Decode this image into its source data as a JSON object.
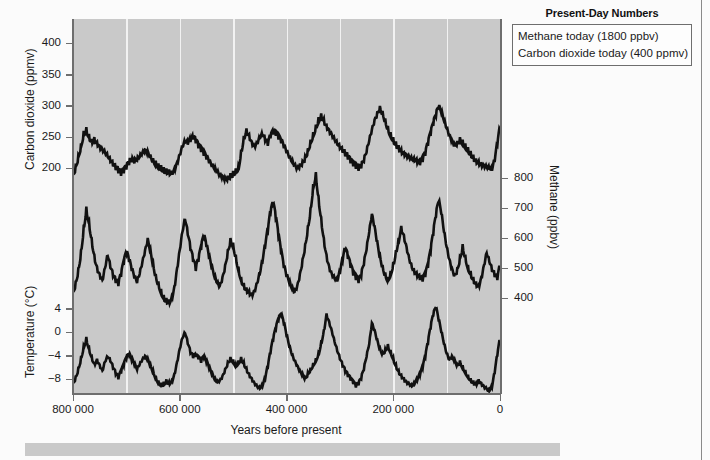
{
  "figure": {
    "xaxis_title": "Years before present",
    "legend": {
      "title": "Present-Day Numbers",
      "rows": [
        "Methane today (1800 ppbv)",
        "Carbon dioxide today (400 ppmv)"
      ]
    },
    "axes": {
      "co2_title": "Carbon dioxide (ppmv)",
      "methane_title": "Methane (ppbv)",
      "temperature_title": "Temperature (°C)",
      "co2_ticks": [
        "400",
        "350",
        "300",
        "250",
        "200"
      ],
      "methane_ticks": [
        "800",
        "700",
        "600",
        "500",
        "400"
      ],
      "temperature_ticks": [
        "4",
        "0",
        "−4",
        "−8"
      ],
      "x_ticks": [
        "800 000",
        "600 000",
        "400 000",
        "200 000",
        "0"
      ]
    },
    "colors": {
      "plot_background": "#c9c9c9",
      "gridline": "#f2f2f2",
      "trace": "#111111",
      "axis": "#6e6e6e",
      "page_background": "#fbfbfb",
      "caption_strip": "#c9c9c9"
    }
  },
  "chart_data": {
    "type": "line",
    "title": "",
    "subtitle": "",
    "xlabel": "Years before present",
    "ylabel": "",
    "grid": "vertical-only",
    "legend_position": "top-right-box",
    "x_reversed": true,
    "xlim": [
      800000,
      0
    ],
    "x_ticks": [
      800000,
      600000,
      400000,
      200000,
      0
    ],
    "x_tick_labels": [
      "800 000",
      "600 000",
      "400 000",
      "200 000",
      "0"
    ],
    "panels": [
      {
        "name": "Carbon dioxide",
        "axis_side": "left",
        "units": "ppmv",
        "ylabel": "Carbon dioxide (ppmv)",
        "ylim": [
          170,
          420
        ],
        "y_ticks": [
          200,
          250,
          300,
          350,
          400
        ],
        "present_day_value": 400,
        "series_name": "Carbon dioxide",
        "x": [
          800000,
          795000,
          790000,
          785000,
          780000,
          775000,
          770000,
          765000,
          760000,
          755000,
          750000,
          745000,
          740000,
          735000,
          730000,
          725000,
          720000,
          715000,
          710000,
          705000,
          700000,
          695000,
          690000,
          685000,
          680000,
          675000,
          670000,
          665000,
          660000,
          655000,
          650000,
          645000,
          640000,
          635000,
          630000,
          625000,
          620000,
          615000,
          610000,
          605000,
          600000,
          595000,
          590000,
          585000,
          580000,
          575000,
          570000,
          565000,
          560000,
          555000,
          550000,
          545000,
          540000,
          535000,
          530000,
          525000,
          520000,
          515000,
          510000,
          505000,
          500000,
          495000,
          490000,
          485000,
          480000,
          475000,
          470000,
          465000,
          460000,
          455000,
          450000,
          445000,
          440000,
          435000,
          430000,
          425000,
          420000,
          415000,
          410000,
          405000,
          400000,
          395000,
          390000,
          385000,
          380000,
          375000,
          370000,
          365000,
          360000,
          355000,
          350000,
          345000,
          340000,
          335000,
          330000,
          325000,
          320000,
          315000,
          310000,
          305000,
          300000,
          295000,
          290000,
          285000,
          280000,
          275000,
          270000,
          265000,
          260000,
          255000,
          250000,
          245000,
          240000,
          235000,
          230000,
          225000,
          220000,
          215000,
          210000,
          205000,
          200000,
          195000,
          190000,
          185000,
          180000,
          175000,
          170000,
          165000,
          160000,
          155000,
          150000,
          145000,
          140000,
          135000,
          130000,
          125000,
          120000,
          115000,
          110000,
          105000,
          100000,
          95000,
          90000,
          85000,
          80000,
          75000,
          70000,
          65000,
          60000,
          55000,
          50000,
          45000,
          40000,
          35000,
          30000,
          25000,
          20000,
          15000,
          10000,
          5000,
          0
        ],
        "values": [
          190,
          205,
          222,
          240,
          260,
          266,
          255,
          247,
          250,
          243,
          236,
          231,
          225,
          218,
          210,
          203,
          197,
          192,
          188,
          192,
          198,
          205,
          210,
          208,
          212,
          218,
          225,
          230,
          228,
          222,
          216,
          212,
          208,
          205,
          202,
          200,
          198,
          196,
          200,
          210,
          222,
          234,
          241,
          238,
          242,
          246,
          240,
          232,
          226,
          220,
          214,
          208,
          202,
          198,
          194,
          190,
          188,
          186,
          188,
          192,
          196,
          200,
          205,
          230,
          252,
          264,
          255,
          243,
          236,
          240,
          248,
          252,
          243,
          236,
          248,
          254,
          252,
          246,
          240,
          232,
          224,
          216,
          210,
          205,
          201,
          206,
          212,
          220,
          232,
          246,
          258,
          270,
          282,
          288,
          280,
          270,
          262,
          254,
          246,
          238,
          231,
          225,
          219,
          214,
          208,
          203,
          199,
          196,
          200,
          210,
          225,
          244,
          262,
          278,
          290,
          300,
          292,
          280,
          268,
          258,
          250,
          243,
          237,
          231,
          226,
          222,
          218,
          214,
          211,
          208,
          205,
          210,
          220,
          236,
          252,
          268,
          282,
          296,
          288,
          276,
          264,
          254,
          246,
          240,
          244,
          250,
          246,
          240,
          234,
          228,
          222,
          216,
          212,
          208,
          205,
          202,
          199,
          196,
          210,
          236,
          262,
          278,
          284
        ],
        "description": "Antarctic ice-core atmospheric CO2 over the past 800,000 years, oscillating between about 180 ppmv in glacial periods and 280-300 ppmv in interglacials."
      },
      {
        "name": "Methane",
        "axis_side": "right",
        "units": "ppbv",
        "ylabel": "Methane (ppbv)",
        "ylim": [
          330,
          830
        ],
        "y_ticks": [
          400,
          500,
          600,
          700,
          800
        ],
        "present_day_value": 1800,
        "series_name": "Methane",
        "x": [
          800000,
          795000,
          790000,
          785000,
          780000,
          775000,
          770000,
          765000,
          760000,
          755000,
          750000,
          745000,
          740000,
          735000,
          730000,
          725000,
          720000,
          715000,
          710000,
          705000,
          700000,
          695000,
          690000,
          685000,
          680000,
          675000,
          670000,
          665000,
          660000,
          655000,
          650000,
          645000,
          640000,
          635000,
          630000,
          625000,
          620000,
          615000,
          610000,
          605000,
          600000,
          595000,
          590000,
          585000,
          580000,
          575000,
          570000,
          565000,
          560000,
          555000,
          550000,
          545000,
          540000,
          535000,
          530000,
          525000,
          520000,
          515000,
          510000,
          505000,
          500000,
          495000,
          490000,
          485000,
          480000,
          475000,
          470000,
          465000,
          460000,
          455000,
          450000,
          445000,
          440000,
          435000,
          430000,
          425000,
          420000,
          415000,
          410000,
          405000,
          400000,
          395000,
          390000,
          385000,
          380000,
          375000,
          370000,
          365000,
          360000,
          355000,
          350000,
          345000,
          340000,
          335000,
          330000,
          325000,
          320000,
          315000,
          310000,
          305000,
          300000,
          295000,
          290000,
          285000,
          280000,
          275000,
          270000,
          265000,
          260000,
          255000,
          250000,
          245000,
          240000,
          235000,
          230000,
          225000,
          220000,
          215000,
          210000,
          205000,
          200000,
          195000,
          190000,
          185000,
          180000,
          175000,
          170000,
          165000,
          160000,
          155000,
          150000,
          145000,
          140000,
          135000,
          130000,
          125000,
          120000,
          115000,
          110000,
          105000,
          100000,
          95000,
          90000,
          85000,
          80000,
          75000,
          70000,
          65000,
          60000,
          55000,
          50000,
          45000,
          40000,
          35000,
          30000,
          25000,
          20000,
          15000,
          10000,
          5000,
          0
        ],
        "values": [
          420,
          455,
          500,
          560,
          640,
          705,
          660,
          600,
          545,
          505,
          480,
          460,
          500,
          540,
          500,
          470,
          450,
          440,
          470,
          510,
          545,
          520,
          490,
          465,
          450,
          480,
          520,
          560,
          600,
          565,
          520,
          480,
          455,
          430,
          410,
          400,
          395,
          405,
          440,
          500,
          560,
          620,
          660,
          610,
          560,
          520,
          490,
          520,
          560,
          600,
          570,
          530,
          495,
          470,
          450,
          440,
          470,
          510,
          560,
          600,
          585,
          545,
          505,
          470,
          450,
          435,
          425,
          415,
          425,
          450,
          480,
          520,
          570,
          620,
          680,
          710,
          660,
          600,
          545,
          500,
          470,
          450,
          430,
          420,
          440,
          480,
          530,
          580,
          640,
          700,
          780,
          820,
          740,
          670,
          600,
          545,
          505,
          480,
          465,
          455,
          480,
          520,
          560,
          530,
          500,
          475,
          460,
          450,
          470,
          510,
          560,
          620,
          680,
          640,
          590,
          545,
          510,
          485,
          470,
          490,
          520,
          560,
          600,
          640,
          610,
          570,
          530,
          500,
          480,
          470,
          460,
          455,
          470,
          500,
          550,
          610,
          670,
          720,
          680,
          620,
          570,
          530,
          500,
          480,
          500,
          540,
          580,
          545,
          510,
          490,
          470,
          455,
          445,
          470,
          510,
          550,
          520,
          490,
          470,
          460,
          500,
          570,
          650,
          710,
          620
        ],
        "description": "Ice-core atmospheric methane over the past 800,000 years, cycling between roughly 350 ppbv in glacials and 700-800 ppbv in interglacials."
      },
      {
        "name": "Temperature",
        "axis_side": "left",
        "units": "°C",
        "ylabel": "Temperature (°C)",
        "ylim": [
          -11,
          6
        ],
        "y_ticks": [
          -8,
          -4,
          0,
          4
        ],
        "series_name": "Temperature anomaly",
        "x": [
          800000,
          795000,
          790000,
          785000,
          780000,
          775000,
          770000,
          765000,
          760000,
          755000,
          750000,
          745000,
          740000,
          735000,
          730000,
          725000,
          720000,
          715000,
          710000,
          705000,
          700000,
          695000,
          690000,
          685000,
          680000,
          675000,
          670000,
          665000,
          660000,
          655000,
          650000,
          645000,
          640000,
          635000,
          630000,
          625000,
          620000,
          615000,
          610000,
          605000,
          600000,
          595000,
          590000,
          585000,
          580000,
          575000,
          570000,
          565000,
          560000,
          555000,
          550000,
          545000,
          540000,
          535000,
          530000,
          525000,
          520000,
          515000,
          510000,
          505000,
          500000,
          495000,
          490000,
          485000,
          480000,
          475000,
          470000,
          465000,
          460000,
          455000,
          450000,
          445000,
          440000,
          435000,
          430000,
          425000,
          420000,
          415000,
          410000,
          405000,
          400000,
          395000,
          390000,
          385000,
          380000,
          375000,
          370000,
          365000,
          360000,
          355000,
          350000,
          345000,
          340000,
          335000,
          330000,
          325000,
          320000,
          315000,
          310000,
          305000,
          300000,
          295000,
          290000,
          285000,
          280000,
          275000,
          270000,
          265000,
          260000,
          255000,
          250000,
          245000,
          240000,
          235000,
          230000,
          225000,
          220000,
          215000,
          210000,
          205000,
          200000,
          195000,
          190000,
          185000,
          180000,
          175000,
          170000,
          165000,
          160000,
          155000,
          150000,
          145000,
          140000,
          135000,
          130000,
          125000,
          120000,
          115000,
          110000,
          105000,
          100000,
          95000,
          90000,
          85000,
          80000,
          75000,
          70000,
          65000,
          60000,
          55000,
          50000,
          45000,
          40000,
          35000,
          30000,
          25000,
          20000,
          15000,
          10000,
          5000,
          0
        ],
        "values": [
          -8.6,
          -7.5,
          -6.0,
          -4.2,
          -2.2,
          -0.8,
          -2.5,
          -4.0,
          -5.2,
          -4.5,
          -5.5,
          -6.5,
          -5.0,
          -4.2,
          -5.0,
          -6.2,
          -7.2,
          -8.0,
          -7.0,
          -5.8,
          -4.6,
          -4.0,
          -4.8,
          -5.6,
          -6.4,
          -5.5,
          -4.6,
          -4.0,
          -4.4,
          -5.4,
          -6.4,
          -7.4,
          -8.2,
          -8.6,
          -8.4,
          -8.0,
          -8.4,
          -8.2,
          -7.0,
          -5.0,
          -2.8,
          -1.0,
          -0.2,
          -2.0,
          -3.6,
          -4.4,
          -4.2,
          -4.6,
          -5.2,
          -4.4,
          -5.2,
          -6.2,
          -7.2,
          -8.0,
          -8.5,
          -8.2,
          -7.4,
          -6.2,
          -5.0,
          -4.2,
          -4.6,
          -5.4,
          -4.8,
          -4.2,
          -5.0,
          -6.0,
          -7.0,
          -7.8,
          -8.6,
          -9.2,
          -9.6,
          -9.2,
          -8.0,
          -6.0,
          -3.6,
          -1.4,
          0.4,
          2.0,
          2.8,
          1.4,
          -0.6,
          -2.4,
          -3.8,
          -4.8,
          -5.6,
          -6.4,
          -7.0,
          -7.6,
          -6.8,
          -6.0,
          -5.2,
          -4.4,
          -3.4,
          -1.6,
          0.4,
          3.2,
          1.8,
          0.2,
          -1.6,
          -3.2,
          -4.6,
          -5.8,
          -6.8,
          -7.6,
          -8.2,
          -8.8,
          -9.4,
          -9.0,
          -8.0,
          -6.4,
          -4.2,
          -2.0,
          1.6,
          0.4,
          -1.2,
          -2.6,
          -3.4,
          -2.8,
          -2.0,
          -3.0,
          -4.2,
          -5.4,
          -6.4,
          -7.2,
          -7.8,
          -8.4,
          -8.8,
          -9.2,
          -8.8,
          -8.2,
          -7.4,
          -6.2,
          -4.4,
          -2.0,
          0.6,
          2.8,
          4.0,
          2.0,
          0.0,
          -2.0,
          -3.6,
          -4.6,
          -4.0,
          -4.6,
          -5.4,
          -4.8,
          -5.6,
          -6.4,
          -7.2,
          -7.8,
          -8.2,
          -8.6,
          -8.0,
          -8.6,
          -9.2,
          -9.6,
          -10.0,
          -9.4,
          -7.0,
          -4.0,
          -1.4,
          0.6,
          -1.8
        ],
        "description": "Antarctic temperature anomaly relative to present over the past 800,000 years, ranging from about -10 °C in glacial maxima to +4 °C in peak interglacials."
      }
    ]
  }
}
